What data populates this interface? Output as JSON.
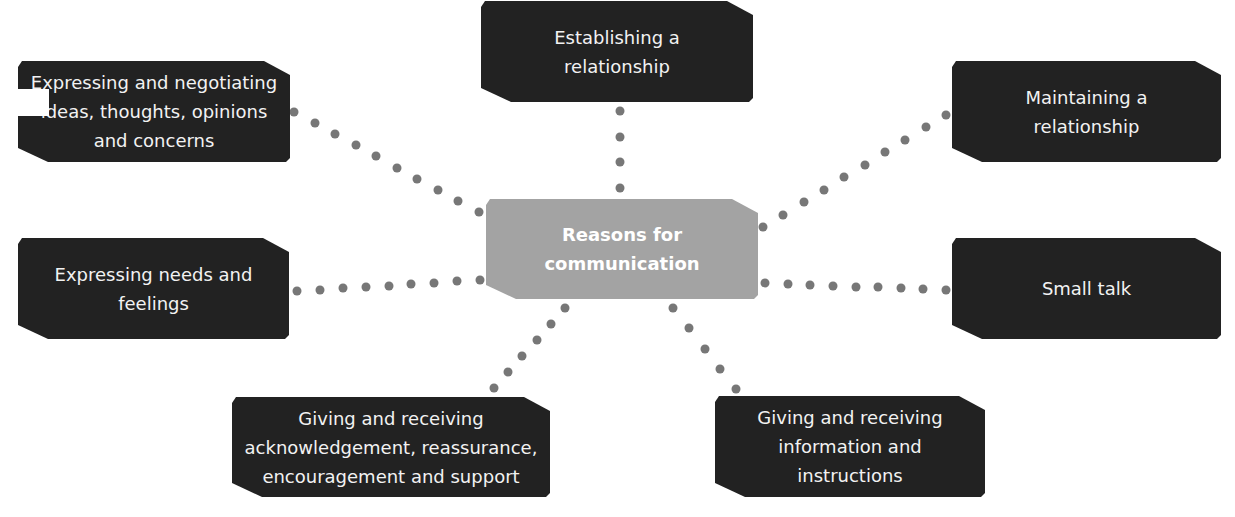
{
  "diagram": {
    "type": "mind-map",
    "center": {
      "label": "Reasons for\ncommunication",
      "color": "#a3a3a3"
    },
    "nodes": [
      {
        "id": "establishing",
        "label": "Establishing a\nrelationship"
      },
      {
        "id": "maintaining",
        "label": "Maintaining a\nrelationship"
      },
      {
        "id": "small-talk",
        "label": "Small talk"
      },
      {
        "id": "information",
        "label": "Giving and receiving\ninformation and\ninstructions"
      },
      {
        "id": "acknowledgement",
        "label": "Giving and receiving\nacknowledgement, reassurance,\nencouragement and support"
      },
      {
        "id": "needs",
        "label": "Expressing needs and\nfeelings"
      },
      {
        "id": "negotiating",
        "label": "Expressing and negotiating\nideas, thoughts, opinions\nand concerns"
      }
    ],
    "node_color": "#222222",
    "text_color": "#f2f2f2",
    "connector_style": "dotted",
    "connector_color": "#777777"
  }
}
